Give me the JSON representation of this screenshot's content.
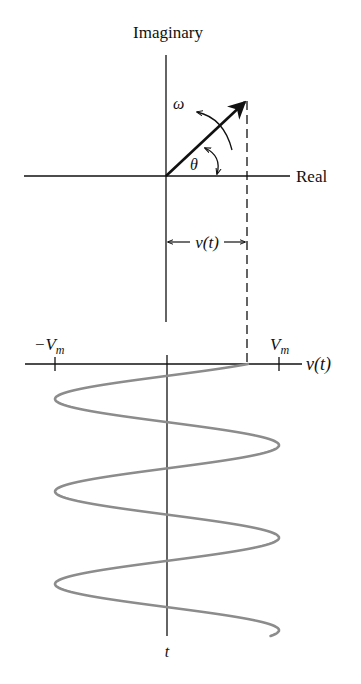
{
  "diagram": {
    "upper_plot": {
      "vertical_axis_label": "Imaginary",
      "horizontal_axis_label": "Real",
      "rotation_label": "ω",
      "angle_label": "θ",
      "projection_label": "v(t)"
    },
    "lower_plot": {
      "horizontal_axis_label": "v(t)",
      "neg_tick_label": "−V",
      "neg_tick_sub": "m",
      "pos_tick_label": "V",
      "pos_tick_sub": "m",
      "vertical_axis_label": "t"
    },
    "colors": {
      "line": "#111111",
      "waveform": "#8c8c8c"
    }
  },
  "geometry": {
    "origin_upper": [
      166,
      176
    ],
    "phasor_tip": [
      247,
      100
    ],
    "origin_lower": [
      167,
      364
    ],
    "amplitude_px": 112,
    "period_px": 92.5,
    "first_left_peak_y": 399,
    "wave_end_y": 636
  }
}
